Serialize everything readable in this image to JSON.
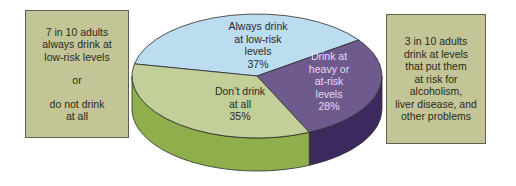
{
  "chart_data": {
    "type": "pie",
    "style": "3d",
    "title": "",
    "slices": [
      {
        "name": "always-low-risk",
        "label_lines": [
          "Always drink",
          "at low-risk",
          "levels",
          "37%"
        ],
        "value": 37,
        "color": "#bcdcf0",
        "side_color": "#9ec0d8",
        "text_color": "#2a2a2a"
      },
      {
        "name": "heavy-at-risk",
        "label_lines": [
          "Drink at",
          "heavy or",
          "at-risk",
          "levels",
          "28%"
        ],
        "value": 28,
        "color": "#6f5a8e",
        "side_color": "#3c2a5e",
        "text_color": "#e4dcf0"
      },
      {
        "name": "dont-drink",
        "label_lines": [
          "Don’t drink",
          "at all",
          "35%"
        ],
        "value": 35,
        "color": "#c2cf98",
        "side_color": "#8fae4c",
        "text_color": "#2a2a2a"
      }
    ]
  },
  "notes": {
    "left": {
      "lines_a": [
        "7 in 10 adults",
        "always drink at",
        "low-risk levels"
      ],
      "middle": "or",
      "lines_b": [
        "do not drink",
        "at all"
      ]
    },
    "right": {
      "lines": [
        "3 in 10 adults",
        "drink at levels",
        "that put them",
        "at risk for",
        "alcoholism,",
        "liver disease, and",
        "other problems"
      ]
    }
  }
}
